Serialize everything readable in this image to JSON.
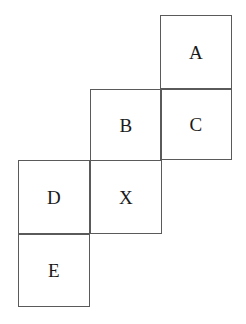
{
  "figure": {
    "kind": "overlapping-squares-staircase-diagram",
    "background_color": "#ffffff",
    "stroke_color": "#5a5a5a",
    "stroke_width_px": 1,
    "label_color": "#1a1a1a",
    "square_size_px": 72,
    "cells": [
      {
        "id": "a",
        "label": "A",
        "x": 160,
        "y": 15,
        "width": 72,
        "height": 74
      },
      {
        "id": "b",
        "label": "B",
        "x": 90,
        "y": 89,
        "width": 72,
        "height": 72
      },
      {
        "id": "c",
        "label": "C",
        "x": 160,
        "y": 89,
        "width": 72,
        "height": 71
      },
      {
        "id": "d",
        "label": "D",
        "x": 18,
        "y": 160,
        "width": 72,
        "height": 74
      },
      {
        "id": "x",
        "label": "X",
        "x": 90,
        "y": 160,
        "width": 72,
        "height": 74
      },
      {
        "id": "e",
        "label": "E",
        "x": 18,
        "y": 234,
        "width": 72,
        "height": 73
      }
    ]
  }
}
